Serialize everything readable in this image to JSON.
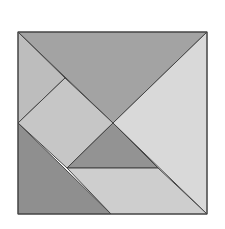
{
  "diagram": {
    "type": "tangram",
    "canvas": {
      "width": 225,
      "height": 229,
      "background": "#ffffff"
    },
    "outline": {
      "stroke": "#444444",
      "square": [
        [
          18,
          32
        ],
        [
          207,
          32
        ],
        [
          207,
          214
        ],
        [
          18,
          214
        ]
      ]
    },
    "pieces": [
      {
        "id": "large-triangle-top",
        "points": "18,32 207,32 113,123",
        "fill": "#a3a3a3"
      },
      {
        "id": "large-triangle-right",
        "points": "207,32 207,214 113,123",
        "fill": "#d9d9d9"
      },
      {
        "id": "small-triangle-top-left",
        "points": "18,32 65,78 18,123",
        "fill": "#bdbdbd"
      },
      {
        "id": "square",
        "points": "65,78 113,123 67,168 18,123",
        "fill": "#c6c6c6"
      },
      {
        "id": "medium-triangle-left",
        "points": "18,123 111,214 18,214",
        "fill": "#8f8f8f"
      },
      {
        "id": "small-triangle-center",
        "points": "113,123 158,168 67,168",
        "fill": "#939393"
      },
      {
        "id": "parallelogram",
        "points": "67,168 158,168 207,214 111,214",
        "fill": "#cecece"
      }
    ]
  }
}
